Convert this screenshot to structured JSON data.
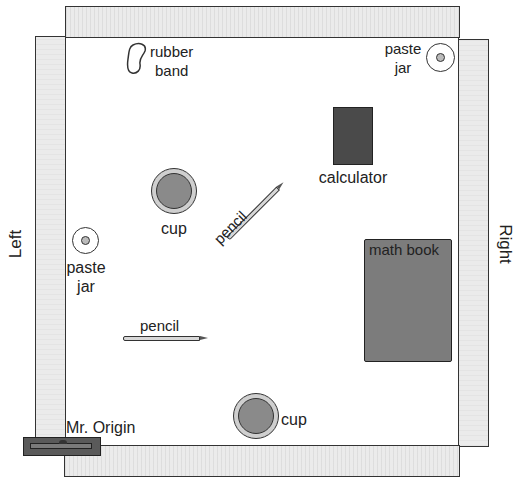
{
  "diagram": {
    "type": "desk top view with edge rulers",
    "side_labels": {
      "left": "Left",
      "right": "Right"
    },
    "origin": {
      "label": "Mr. Origin"
    },
    "objects": [
      {
        "id": "rubber-band",
        "label_line1": "rubber",
        "label_line2": "band"
      },
      {
        "id": "paste-jar-top-right",
        "label_line1": "paste",
        "label_line2": "jar"
      },
      {
        "id": "calculator",
        "label": "calculator"
      },
      {
        "id": "cup-upper",
        "label": "cup"
      },
      {
        "id": "pencil-diagonal",
        "label": "pencil"
      },
      {
        "id": "paste-jar-left",
        "label_line1": "paste",
        "label_line2": "jar"
      },
      {
        "id": "math-book",
        "label": "math book"
      },
      {
        "id": "pencil-horizontal",
        "label": "pencil"
      },
      {
        "id": "cup-lower",
        "label": "cup"
      }
    ],
    "colors": {
      "strip": "#ebebeb",
      "outline": "#333333",
      "calculator": "#4a4a4a",
      "math_book": "#7c7c7c",
      "cup_inner": "#8a8a8a",
      "origin_block": "#5a5a5a"
    }
  }
}
